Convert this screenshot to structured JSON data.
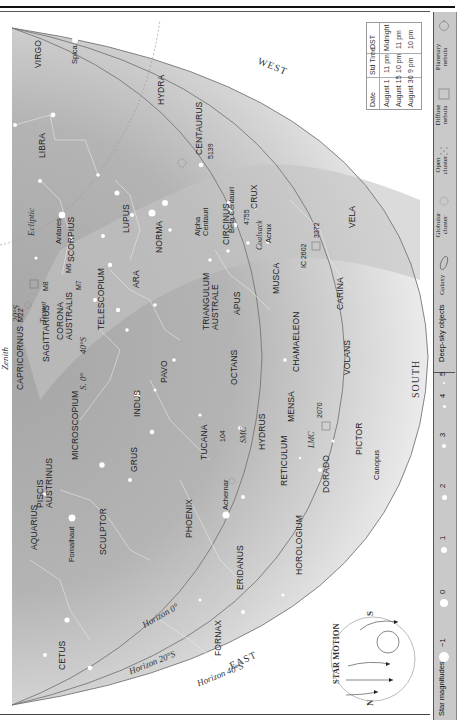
{
  "orientation": "rotated-90-ccw",
  "chart": {
    "directions": {
      "west": "WEST",
      "south": "SOUTH",
      "east": "EAST"
    },
    "horizons": [
      "Horizon 0°",
      "Horizon 20°S",
      "Horizon 40°S"
    ],
    "zenith": {
      "label": "Zenith",
      "lat_20": "20°S",
      "lat_40": "40°S",
      "southern_label": "S. 0°"
    },
    "ecliptic": "Ecliptic",
    "constellations": [
      "VIRGO",
      "LIBRA",
      "HYDRA",
      "CENTAURUS",
      "LUPUS",
      "SCORPIUS",
      "NORMA",
      "CIRCINUS",
      "CRUX",
      "VELA",
      "MUSCA",
      "CARINA",
      "CHAMAELEON",
      "VOLANS",
      "TRIANGULUM AUSTRALE",
      "APUS",
      "ARA",
      "TELESCOPIUM",
      "CORONA AUSTRALIS",
      "SAGITTARIUS",
      "CAPRICORNUS",
      "MICROSCOPIUM",
      "INDUS",
      "PAVO",
      "OCTANS",
      "HYDRUS",
      "MENSA",
      "TUCANA",
      "GRUS",
      "PISCIS AUSTRINUS",
      "AQUARIUS",
      "SCULPTOR",
      "PHOENIX",
      "RETICULUM",
      "DORADO",
      "PICTOR",
      "HOROLOGIUM",
      "ERIDANUS",
      "FORNAX",
      "CETUS"
    ],
    "stars": [
      "Spica",
      "Antares",
      "Alpha Centauri",
      "Beta Centauri",
      "Acrux",
      "Fomalhaut",
      "Achernar",
      "Canopus"
    ],
    "asterisms": [
      "Teapot",
      "Coalsack"
    ],
    "deep_sky": [
      "M22",
      "M8",
      "M6",
      "M7",
      "5139",
      "4755",
      "IC 2602",
      "3372",
      "104",
      "SMC",
      "LMC",
      "2070"
    ]
  },
  "time_table": {
    "headers": [
      "Date",
      "Std Time",
      "DST"
    ],
    "rows": [
      [
        "August 1",
        "11 pm",
        "Midnight"
      ],
      [
        "August 15",
        "10 pm",
        "11 pm"
      ],
      [
        "August 30",
        "9 pm",
        "10 pm"
      ]
    ]
  },
  "star_motion": {
    "title": "STAR MOTION",
    "north": "N",
    "south": "S"
  },
  "legend": {
    "magnitudes_label": "Star magnitudes",
    "magnitudes": [
      "−1",
      "0",
      "1",
      "2",
      "3",
      "4",
      "5"
    ],
    "deep_sky_label": "Deep-sky objects",
    "deep_sky_types": [
      "Galaxy",
      "Globular cluster",
      "Open cluster",
      "Diffuse nebula",
      "Planetary nebula"
    ]
  },
  "colors": {
    "sky_dark": "#a9a9a9",
    "sky_light": "#e6e6e6",
    "legend_bg": "#c9c9c9",
    "line": "#444444"
  }
}
